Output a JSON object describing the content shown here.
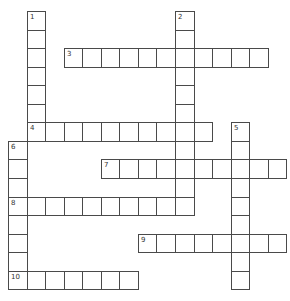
{
  "puzzle": {
    "cell_size": 18.55,
    "origin": [
      8,
      11
    ],
    "border_color": "#4a4a4a",
    "words": [
      {
        "number": "1",
        "direction": "down",
        "row": 0,
        "col": 1,
        "length": 7
      },
      {
        "number": "2",
        "direction": "down",
        "row": 0,
        "col": 9,
        "length": 11
      },
      {
        "number": "3",
        "direction": "across",
        "row": 2,
        "col": 3,
        "length": 11
      },
      {
        "number": "4",
        "direction": "across",
        "row": 6,
        "col": 1,
        "length": 10
      },
      {
        "number": "5",
        "direction": "down",
        "row": 6,
        "col": 12,
        "length": 9
      },
      {
        "number": "6",
        "direction": "down",
        "row": 7,
        "col": 0,
        "length": 8
      },
      {
        "number": "7",
        "direction": "across",
        "row": 8,
        "col": 5,
        "length": 10
      },
      {
        "number": "8",
        "direction": "across",
        "row": 10,
        "col": 0,
        "length": 10
      },
      {
        "number": "9",
        "direction": "across",
        "row": 12,
        "col": 7,
        "length": 8
      },
      {
        "number": "10",
        "direction": "across",
        "row": 14,
        "col": 0,
        "length": 7
      }
    ]
  }
}
